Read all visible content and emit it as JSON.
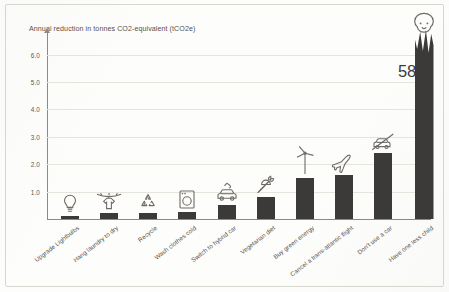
{
  "chart_data": {
    "type": "bar",
    "title": "Annual reduction in tonnes CO2-equivalent (tCO2e)",
    "xlabel": "",
    "ylabel": "",
    "ylim": [
      0,
      6.6
    ],
    "grid": true,
    "legend": "none",
    "axis_note": "y-axis is broken; final bar is drawn torn/clipped with its value labelled",
    "categories": [
      "Upgrade Lightbulbs",
      "Hang laundry to dry",
      "Recycle",
      "Wash clothes cold",
      "Switch to hybrid car",
      "Vegetarian diet",
      "Buy green energy",
      "Cancel a trans-atlantic flight",
      "Don't use a car",
      "Have one less child"
    ],
    "values": [
      0.1,
      0.21,
      0.21,
      0.25,
      0.52,
      0.82,
      1.5,
      1.6,
      2.4,
      58.6
    ],
    "value_labels": [
      "",
      "",
      "",
      "",
      "",
      "",
      "",
      "",
      "",
      "58.6"
    ],
    "yticks": [
      "1.0",
      "2.0",
      "3.0",
      "4.0",
      "5.0",
      "6.0"
    ],
    "ytick_values": [
      1.0,
      2.0,
      3.0,
      4.0,
      5.0,
      6.0
    ],
    "icons": [
      "lightbulb-icon",
      "laundry-line-icon",
      "recycle-icon",
      "washing-machine-icon",
      "hybrid-car-icon",
      "carrot-icon",
      "wind-turbine-icon",
      "airplane-icon",
      "no-car-icon",
      "baby-face-icon"
    ],
    "colors": {
      "bar": "#3c3a38",
      "grid": "#e7e4de",
      "axis": "#8d8a85",
      "text": "#55524e",
      "icon": "#6f6c67",
      "background": "#fdfdfc"
    }
  }
}
